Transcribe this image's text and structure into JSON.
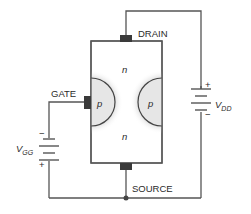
{
  "diagram": {
    "terminals": {
      "drain": "DRAIN",
      "gate": "GATE",
      "source": "SOURCE"
    },
    "regions": {
      "n_top": "n",
      "n_bottom": "n",
      "p_left": "p",
      "p_right": "p"
    },
    "sources": {
      "vdd": {
        "main": "V",
        "sub": "DD",
        "plus": "+",
        "minus": "−"
      },
      "vgg": {
        "main": "V",
        "sub": "GG",
        "plus": "+",
        "minus": "−"
      }
    },
    "colors": {
      "wire": "#555555",
      "contact": "#3a3a3a",
      "depletion": "#d9d9d9",
      "p_region": "#e6e6e6",
      "body": "#ffffff",
      "text": "#2a2a2a"
    }
  }
}
